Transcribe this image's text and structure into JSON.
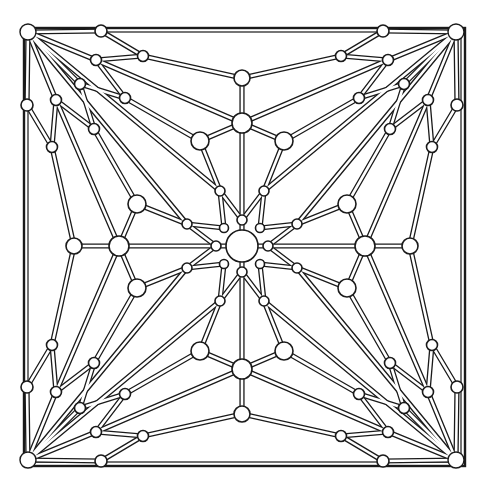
{
  "diagram": {
    "title": "",
    "colors": {
      "stroke": "#1a1a1a",
      "fill": "#ffffff",
      "background": "#ffffff"
    },
    "canvas": {
      "width": 488,
      "height": 495
    },
    "center": [
      242,
      246
    ],
    "frame": {
      "x1": 24,
      "y1": 28,
      "x2": 465,
      "y2": 466
    },
    "bar_width": 5.2,
    "symmetry": "D4 (4-fold rotation with mirror)",
    "octant_nodes": {
      "center": {
        "p": [
          0,
          0
        ],
        "r": 16
      },
      "ring_axis": {
        "p": [
          0,
          -26
        ],
        "r": 5
      },
      "ring_diag": {
        "p": [
          -18,
          -18
        ],
        "r": 4.5
      },
      "star_tip": {
        "p": [
          -22,
          -55
        ],
        "r": 5
      },
      "hub_big": {
        "p": [
          0,
          -123
        ],
        "r": 10
      },
      "hub_top": {
        "p": [
          0,
          -168
        ],
        "r": 8
      },
      "mid_diag": {
        "p": [
          -42,
          -105
        ],
        "r": 9
      },
      "edge_node": {
        "p": [
          -141,
          -215
        ],
        "r": 6
      },
      "z1a": {
        "p": [
          -99,
          -190
        ],
        "r": 5.5
      },
      "z1b": {
        "p": [
          -146,
          -186
        ],
        "r": 5.5
      },
      "z2a": {
        "p": [
          -117,
          -148
        ],
        "r": 5.5
      },
      "z2b": {
        "p": [
          -162,
          -162
        ],
        "r": 5.5
      },
      "corner": {
        "p": [
          -214,
          -214
        ],
        "r": 8
      }
    },
    "octant_bars": [
      [
        "center",
        "ring_axis"
      ],
      [
        "ring_axis",
        "hub_big"
      ],
      [
        "hub_big",
        "hub_top"
      ],
      [
        "ring_diag",
        "star_tip"
      ],
      [
        "star_tip",
        "ring_axis"
      ],
      [
        "star_tip",
        "mid_diag"
      ],
      [
        "mid_diag",
        "hub_big"
      ],
      [
        "hub_top",
        "z1a"
      ],
      [
        "hub_big",
        "z1b"
      ],
      [
        "z1a",
        "edge_node"
      ],
      [
        "z1a",
        "z1b"
      ],
      [
        "z1b",
        "corner"
      ],
      [
        "mid_diag",
        "z2a"
      ],
      [
        "z2a",
        "z2b"
      ],
      [
        "z2b",
        "corner"
      ],
      [
        "z2a",
        "z1b"
      ],
      [
        "star_tip",
        "corner"
      ],
      [
        "edge_node",
        "corner"
      ]
    ]
  }
}
